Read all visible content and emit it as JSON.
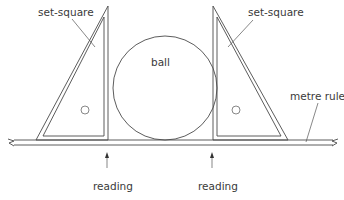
{
  "diagram": {
    "type": "apparatus",
    "labels": {
      "set_square_left": "set-square",
      "set_square_right": "set-square",
      "ball": "ball",
      "metre_rule": "metre rule",
      "reading_left": "reading",
      "reading_right": "reading"
    },
    "components": [
      {
        "id": "set-square-left",
        "label": "set-square"
      },
      {
        "id": "ball",
        "label": "ball"
      },
      {
        "id": "set-square-right",
        "label": "set-square"
      },
      {
        "id": "metre-rule",
        "label": "metre rule"
      }
    ],
    "arrows": [
      {
        "id": "reading-left",
        "label": "reading",
        "direction": "up"
      },
      {
        "id": "reading-right",
        "label": "reading",
        "direction": "up"
      }
    ],
    "colors": {
      "line": "#4a4a4a",
      "text": "#3a3a3a",
      "background": "#ffffff"
    }
  }
}
